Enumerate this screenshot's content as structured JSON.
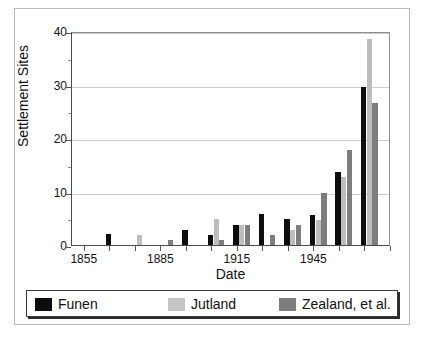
{
  "figure": {
    "background": "#ffffff",
    "frame_color": "#b9b9b9"
  },
  "colors": {
    "funen": "#0d0d0d",
    "jutland": "#bdbdbd",
    "zealand": "#7d7d7d",
    "axis": "#4a4a4a",
    "grid": "#cccccc"
  },
  "axes": {
    "y_title": "Settlement Sites",
    "x_title": "Date",
    "y_ticklabels": [
      "0",
      "10",
      "20",
      "30",
      "40"
    ],
    "x_ticklabels": [
      "1855",
      "1885",
      "1915",
      "1945"
    ]
  },
  "legend": {
    "items": [
      {
        "label": "Funen",
        "swatch": "funen"
      },
      {
        "label": "Jutland",
        "swatch": "jutland"
      },
      {
        "label": "Zealand, et al.",
        "swatch": "zealand"
      }
    ]
  },
  "chart_data": {
    "type": "bar",
    "title": "",
    "subtitle": "",
    "xlabel": "Date",
    "ylabel": "Settlement Sites",
    "ylim": [
      0,
      40
    ],
    "yticks": [
      0,
      10,
      20,
      30,
      40
    ],
    "xlim": [
      1850,
      1975
    ],
    "xticks": [
      1855,
      1885,
      1915,
      1945
    ],
    "grid": "horizontal",
    "legend_position": "bottom",
    "categories": [
      1855,
      1865,
      1875,
      1885,
      1895,
      1905,
      1915,
      1925,
      1935,
      1945,
      1955,
      1965
    ],
    "series": [
      {
        "name": "Funen",
        "color": "#0d0d0d",
        "values": [
          0,
          2,
          0,
          0,
          2.8,
          1.8,
          3.8,
          5.8,
          4.8,
          5.7,
          13.6,
          29.5
        ]
      },
      {
        "name": "Jutland",
        "color": "#bdbdbd",
        "values": [
          0,
          0,
          1.9,
          0,
          0,
          4.9,
          3.8,
          0,
          2.9,
          4.7,
          12.7,
          38.6
        ]
      },
      {
        "name": "Zealand, et al.",
        "color": "#7d7d7d",
        "values": [
          0,
          0,
          0,
          0.9,
          0,
          0.9,
          3.8,
          1.8,
          3.8,
          9.7,
          17.7,
          26.6
        ]
      }
    ]
  }
}
